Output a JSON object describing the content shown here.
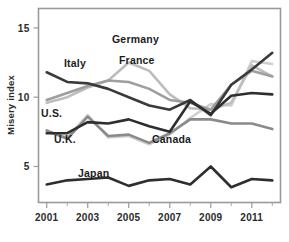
{
  "chart_data": {
    "type": "line",
    "title": "",
    "subtitle": "",
    "xlabel": "",
    "ylabel": "Misery index",
    "x": [
      2001,
      2002,
      2003,
      2004,
      2005,
      2006,
      2007,
      2008,
      2009,
      2010,
      2011,
      2012
    ],
    "xlim": [
      2000.6,
      2012.4
    ],
    "ylim": [
      2.4,
      16.4
    ],
    "yticks": [
      5,
      10,
      15
    ],
    "ytick_labels": [
      "5",
      "10",
      "15"
    ],
    "xticks": [
      2001,
      2003,
      2005,
      2007,
      2009,
      2011
    ],
    "xtick_labels": [
      "2001",
      "2003",
      "2005",
      "2007",
      "2009",
      "2011"
    ],
    "xticks_minor": [
      2002,
      2004,
      2006,
      2008,
      2010,
      2012
    ],
    "grid": false,
    "legend": "inline-annotations",
    "series": [
      {
        "name": "Germany",
        "color": "#bdbdbd",
        "width": 2.6,
        "values": [
          9.6,
          10.0,
          10.7,
          11.2,
          12.5,
          11.9,
          10.2,
          9.2,
          9.1,
          9.6,
          12.3,
          11.5
        ]
      },
      {
        "name": "France",
        "color": "#9e9e9e",
        "width": 2.6,
        "values": [
          9.8,
          10.3,
          10.8,
          11.2,
          11.1,
          10.6,
          9.8,
          9.6,
          9.1,
          10.9,
          11.9,
          11.5
        ]
      },
      {
        "name": "Italy",
        "color": "#3a3a3a",
        "width": 2.6,
        "values": [
          11.8,
          11.1,
          11.0,
          10.6,
          10.0,
          9.4,
          9.1,
          9.8,
          8.7,
          10.9,
          12.0,
          13.2
        ]
      },
      {
        "name": "U.S.",
        "color": "#2e2e2e",
        "width": 2.6,
        "values": [
          7.4,
          7.4,
          8.2,
          8.1,
          8.4,
          7.9,
          7.5,
          9.7,
          8.8,
          10.1,
          10.3,
          10.2
        ]
      },
      {
        "name": "U.K.",
        "color": "#8a8a8a",
        "width": 2.6,
        "values": [
          7.6,
          7.0,
          8.6,
          7.2,
          7.3,
          6.7,
          7.4,
          8.4,
          8.4,
          8.1,
          8.1,
          7.7
        ]
      },
      {
        "name": "Canada",
        "color": "#cfcfcf",
        "width": 2.6,
        "values": [
          7.5,
          7.1,
          8.7,
          7.1,
          7.2,
          6.6,
          7.3,
          8.5,
          9.5,
          9.4,
          12.6,
          12.4
        ]
      },
      {
        "name": "Japan",
        "color": "#2e2e2e",
        "width": 2.6,
        "values": [
          3.7,
          4.0,
          4.1,
          4.2,
          3.6,
          4.0,
          4.1,
          3.7,
          5.0,
          3.5,
          4.1,
          4.0
        ]
      }
    ],
    "annotations": [
      {
        "text": "Germany",
        "x": 112,
        "y": 43
      },
      {
        "text": "France",
        "x": 119,
        "y": 64
      },
      {
        "text": "Italy",
        "x": 64,
        "y": 67
      },
      {
        "text": "U.S.",
        "x": 41,
        "y": 117
      },
      {
        "text": "U.K.",
        "x": 54,
        "y": 143
      },
      {
        "text": "Canada",
        "x": 152,
        "y": 143
      },
      {
        "text": "Japan",
        "x": 78,
        "y": 177
      }
    ]
  }
}
